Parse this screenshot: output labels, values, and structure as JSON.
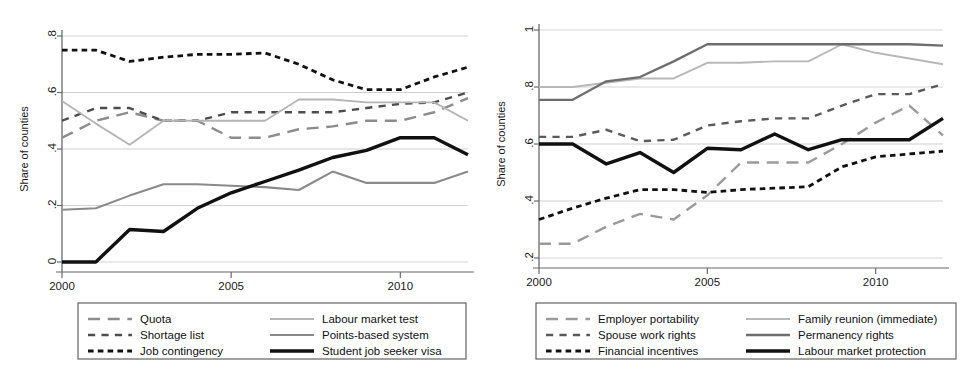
{
  "figure": {
    "ylabel": "Share of counties",
    "xticks": [
      "2000",
      "2005",
      "2010"
    ]
  },
  "chart_data": [
    {
      "type": "line",
      "panel": "left",
      "title": "",
      "xlabel": "",
      "ylabel": "Share of counties",
      "x": [
        2000,
        2001,
        2002,
        2003,
        2004,
        2005,
        2006,
        2007,
        2008,
        2009,
        2010,
        2011,
        2012
      ],
      "xlim": [
        2000,
        2012
      ],
      "ylim": [
        0,
        0.8
      ],
      "yticks": [
        0,
        0.2,
        0.4,
        0.6,
        0.8
      ],
      "ytick_labels": [
        "0",
        ".2",
        ".4",
        ".6",
        ".8"
      ],
      "xticks": [
        2000,
        2005,
        2010
      ],
      "grid": true,
      "legend_position": "below",
      "series": [
        {
          "name": "Quota",
          "style": "long-dash",
          "color": "#8c8c8c",
          "width": 2.4,
          "values": [
            0.44,
            0.5,
            0.53,
            0.5,
            0.5,
            0.44,
            0.44,
            0.47,
            0.48,
            0.5,
            0.5,
            0.53,
            0.58
          ]
        },
        {
          "name": "Shortage list",
          "style": "dash",
          "color": "#4d4d4d",
          "width": 2.4,
          "values": [
            0.5,
            0.545,
            0.545,
            0.5,
            0.5,
            0.53,
            0.53,
            0.53,
            0.53,
            0.545,
            0.56,
            0.565,
            0.6
          ]
        },
        {
          "name": "Job contingency",
          "style": "dot-dash",
          "color": "#111111",
          "width": 2.8,
          "values": [
            0.75,
            0.75,
            0.71,
            0.725,
            0.735,
            0.735,
            0.74,
            0.7,
            0.645,
            0.61,
            0.61,
            0.655,
            0.69
          ]
        },
        {
          "name": "Labour market test",
          "style": "solid",
          "color": "#b5b5b5",
          "width": 1.9,
          "values": [
            0.57,
            0.49,
            0.415,
            0.5,
            0.5,
            0.5,
            0.5,
            0.575,
            0.575,
            0.565,
            0.565,
            0.565,
            0.5
          ]
        },
        {
          "name": "Points-based system",
          "style": "solid",
          "color": "#8a8a8a",
          "width": 2.1,
          "values": [
            0.185,
            0.19,
            0.235,
            0.275,
            0.275,
            0.27,
            0.265,
            0.255,
            0.32,
            0.28,
            0.28,
            0.28,
            0.32
          ]
        },
        {
          "name": "Student job seeker visa",
          "style": "solid",
          "color": "#111111",
          "width": 3.4,
          "values": [
            0.0,
            0.0,
            0.115,
            0.108,
            0.19,
            0.245,
            0.285,
            0.325,
            0.37,
            0.395,
            0.44,
            0.44,
            0.38
          ]
        }
      ]
    },
    {
      "type": "line",
      "panel": "right",
      "title": "",
      "xlabel": "",
      "ylabel": "Share of counties",
      "x": [
        2000,
        2001,
        2002,
        2003,
        2004,
        2005,
        2006,
        2007,
        2008,
        2009,
        2010,
        2011,
        2012
      ],
      "xlim": [
        2000,
        2012
      ],
      "ylim": [
        0.2,
        1.0
      ],
      "yticks": [
        0.2,
        0.4,
        0.6,
        0.8,
        1.0
      ],
      "ytick_labels": [
        ".2",
        ".4",
        ".6",
        ".8",
        "1"
      ],
      "xticks": [
        2000,
        2005,
        2010
      ],
      "grid": true,
      "legend_position": "below",
      "series": [
        {
          "name": "Employer portability",
          "style": "long-dash",
          "color": "#9a9a9a",
          "width": 2.4,
          "values": [
            0.25,
            0.25,
            0.31,
            0.355,
            0.335,
            0.42,
            0.535,
            0.535,
            0.535,
            0.6,
            0.675,
            0.735,
            0.63
          ]
        },
        {
          "name": "Spouse work rights",
          "style": "dash",
          "color": "#5a5a5a",
          "width": 2.4,
          "values": [
            0.625,
            0.625,
            0.65,
            0.61,
            0.615,
            0.665,
            0.68,
            0.69,
            0.69,
            0.735,
            0.775,
            0.775,
            0.81
          ]
        },
        {
          "name": "Financial incentives",
          "style": "dot-dash",
          "color": "#111111",
          "width": 2.8,
          "values": [
            0.335,
            0.375,
            0.41,
            0.44,
            0.44,
            0.43,
            0.44,
            0.445,
            0.45,
            0.52,
            0.555,
            0.565,
            0.575
          ]
        },
        {
          "name": "Family reunion (immediate)",
          "style": "solid",
          "color": "#b8b8b8",
          "width": 1.9,
          "values": [
            0.8,
            0.8,
            0.815,
            0.83,
            0.83,
            0.885,
            0.885,
            0.89,
            0.89,
            0.95,
            0.92,
            0.9,
            0.88
          ]
        },
        {
          "name": "Permanency rights",
          "style": "solid",
          "color": "#6e6e6e",
          "width": 2.3,
          "values": [
            0.755,
            0.755,
            0.82,
            0.835,
            0.89,
            0.95,
            0.95,
            0.95,
            0.95,
            0.95,
            0.95,
            0.95,
            0.945
          ]
        },
        {
          "name": "Labour market protection",
          "style": "solid",
          "color": "#111111",
          "width": 3.4,
          "values": [
            0.6,
            0.6,
            0.53,
            0.57,
            0.5,
            0.585,
            0.58,
            0.635,
            0.58,
            0.615,
            0.615,
            0.615,
            0.69
          ]
        }
      ]
    }
  ],
  "legends": [
    {
      "panel": "left",
      "columns": [
        [
          {
            "label": "Quota",
            "style": "long-dash",
            "color": "#8c8c8c",
            "width": 2.4
          },
          {
            "label": "Shortage list",
            "style": "dash",
            "color": "#4d4d4d",
            "width": 2.4
          },
          {
            "label": "Job contingency",
            "style": "dot-dash",
            "color": "#111111",
            "width": 2.8
          }
        ],
        [
          {
            "label": "Labour market test",
            "style": "solid",
            "color": "#b5b5b5",
            "width": 1.9
          },
          {
            "label": "Points-based system",
            "style": "solid",
            "color": "#8a8a8a",
            "width": 2.1
          },
          {
            "label": "Student job seeker visa",
            "style": "solid",
            "color": "#111111",
            "width": 3.4
          }
        ]
      ]
    },
    {
      "panel": "right",
      "columns": [
        [
          {
            "label": "Employer portability",
            "style": "long-dash",
            "color": "#9a9a9a",
            "width": 2.4
          },
          {
            "label": "Spouse work rights",
            "style": "dash",
            "color": "#5a5a5a",
            "width": 2.4
          },
          {
            "label": "Financial incentives",
            "style": "dot-dash",
            "color": "#111111",
            "width": 2.8
          }
        ],
        [
          {
            "label": "Family reunion (immediate)",
            "style": "solid",
            "color": "#b8b8b8",
            "width": 1.9
          },
          {
            "label": "Permanency rights",
            "style": "solid",
            "color": "#6e6e6e",
            "width": 2.3
          },
          {
            "label": "Labour market protection",
            "style": "solid",
            "color": "#111111",
            "width": 3.4
          }
        ]
      ]
    }
  ],
  "colors": {
    "grid": "#c9c9c9",
    "axis": "#6b6b6b",
    "text": "#1a1a1a",
    "legend_border": "#555555"
  }
}
